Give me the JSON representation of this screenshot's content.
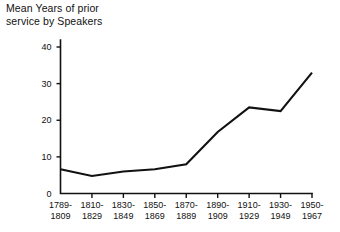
{
  "chart_data": {
    "type": "line",
    "title": "Mean Years of prior\nservice by Speakers",
    "xlabel": "",
    "ylabel": "",
    "categories": [
      "1789-\n1809",
      "1810-\n1829",
      "1830-\n1849",
      "1850-\n1869",
      "1870-\n1889",
      "1890-\n1909",
      "1910-\n1929",
      "1930-\n1949",
      "1950-\n1967"
    ],
    "values": [
      6.6,
      4.8,
      6.0,
      6.6,
      8.0,
      16.8,
      23.5,
      22.5,
      33.0
    ],
    "ylim": [
      0,
      42
    ],
    "yticks": [
      0,
      10,
      20,
      30,
      40
    ],
    "ytick_labels": [
      "0",
      "10",
      "20",
      "30",
      "40"
    ],
    "grid": false,
    "legend": false,
    "line_color": "#111111"
  },
  "figure": {
    "title_line1": "Mean Years of prior",
    "title_line2": "service by Speakers"
  }
}
